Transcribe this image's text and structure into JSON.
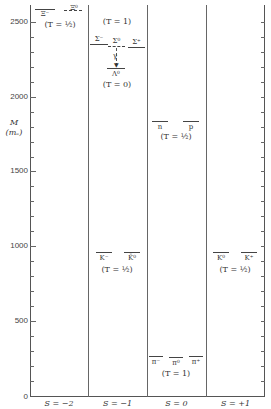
{
  "axis": {
    "title_main": "M",
    "title_unit": "(mₑ)",
    "ticks": [
      "2500",
      "2000",
      "1500",
      "1000",
      "500",
      "0"
    ]
  },
  "columns": [
    {
      "label": "S = −2"
    },
    {
      "label": "S = −1"
    },
    {
      "label": "S = 0"
    },
    {
      "label": "S = +1"
    }
  ],
  "multiplets": {
    "xi": {
      "particles": [
        "Ξ⁻",
        "Ξ⁰"
      ],
      "isospin": "(T = ½)",
      "mass": 2580
    },
    "sigma": {
      "particles": [
        "Σ⁻",
        "Σ⁰",
        "Σ⁺"
      ],
      "isospin": "(T = 1)",
      "mass": 2330
    },
    "lambda": {
      "particles": [
        "Λ⁰"
      ],
      "isospin": "(T = 0)",
      "mass": 2183
    },
    "gamma": "γ",
    "nucleon": {
      "particles": [
        "n",
        "p"
      ],
      "isospin": "(T = ½)",
      "mass": 1838
    },
    "antikaon": {
      "particles": [
        "K⁻",
        "K̄⁰"
      ],
      "isospin": "(T = ½)",
      "mass": 966
    },
    "kaon": {
      "particles": [
        "K⁰",
        "K⁺"
      ],
      "isospin": "(T = ½)",
      "mass": 966
    },
    "pion": {
      "particles": [
        "π⁻",
        "π⁰",
        "π⁺"
      ],
      "isospin": "(T = 1)",
      "mass": 270
    }
  }
}
